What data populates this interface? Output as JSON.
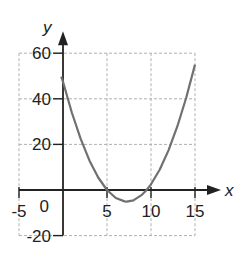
{
  "chart_data": {
    "type": "line",
    "title": "",
    "xlabel": "x",
    "ylabel": "y",
    "xlim": [
      -5,
      15
    ],
    "ylim": [
      -20,
      60
    ],
    "x_ticks": [
      "-5",
      "5",
      "10",
      "15"
    ],
    "y_ticks": [
      "60",
      "40",
      "20",
      "-20"
    ],
    "origin_label": "0",
    "grid": true,
    "legend": null,
    "series": [
      {
        "name": "parabola",
        "color": "#707070",
        "x": [
          -0.2,
          0,
          1,
          2,
          3,
          4,
          5,
          6,
          7,
          7.25,
          8,
          9,
          9.5,
          10,
          11,
          12,
          13,
          14,
          15
        ],
        "y": [
          49.7,
          47.5,
          34,
          22.5,
          13,
          5.5,
          0,
          -3.5,
          -5,
          -5.1,
          -4.5,
          -2,
          0,
          2.5,
          9,
          17.5,
          28,
          40.5,
          55
        ]
      }
    ]
  },
  "colors": {
    "axis": "#222222",
    "grid": "#b0b0b0",
    "curve": "#707070"
  }
}
